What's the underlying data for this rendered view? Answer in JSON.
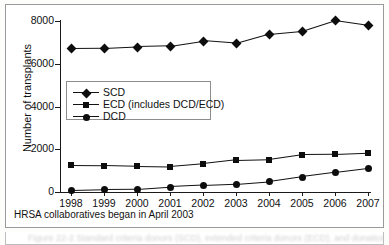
{
  "figure": {
    "footnote": "HRSA collaboratives began in April 2003",
    "caption": "Figure 22-2  Standard criteria donors (SCD), extended criteria donors (ECD), and donation after"
  },
  "chart_data": {
    "type": "line",
    "title": "",
    "xlabel": "",
    "ylabel": "Number of transplants",
    "x": [
      1998,
      1999,
      2000,
      2001,
      2002,
      2003,
      2004,
      2005,
      2006,
      2007
    ],
    "categories": [
      "1998",
      "1999",
      "2000",
      "2001",
      "2002",
      "2003",
      "2004",
      "2005",
      "2006",
      "2007"
    ],
    "xtick_labels": [
      "1998",
      "1999",
      "2000",
      "2001",
      "2002",
      "2003",
      "2004",
      "2005",
      "2006",
      "2007"
    ],
    "ytick_labels": [
      "0",
      "2000",
      "4000",
      "6000",
      "8000"
    ],
    "yticks": [
      0,
      2000,
      4000,
      6000,
      8000
    ],
    "ylim": [
      0,
      8000
    ],
    "xlim": [
      1998,
      2007
    ],
    "grid": false,
    "legend_position": "center-left",
    "series": [
      {
        "name": "SCD",
        "marker": "diamond",
        "values": [
          6700,
          6710,
          6780,
          6820,
          7060,
          6940,
          7380,
          7520,
          8020,
          7800
        ]
      },
      {
        "name": "ECD (includes DCD/ECD)",
        "marker": "square",
        "values": [
          1240,
          1230,
          1200,
          1180,
          1310,
          1490,
          1520,
          1750,
          1760,
          1820
        ]
      },
      {
        "name": "DCD",
        "marker": "circle",
        "values": [
          80,
          120,
          130,
          230,
          300,
          360,
          480,
          700,
          900,
          1090
        ]
      }
    ],
    "colors": {
      "series": "#0d0d0d",
      "axis": "#1a1a1a",
      "background": "#ffffff"
    }
  }
}
